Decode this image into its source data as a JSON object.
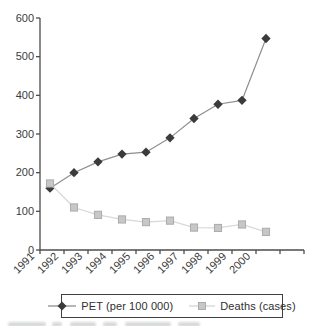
{
  "chart_data": {
    "type": "line",
    "title": "",
    "xlabel": "",
    "ylabel": "",
    "categories": [
      "1991",
      "1992",
      "1993",
      "1994",
      "1995",
      "1996",
      "1997",
      "1998",
      "1999",
      "2000"
    ],
    "series": [
      {
        "name": "PET (per 100 000)",
        "marker": "diamond",
        "marker_color": "#3b3b3b",
        "line_color": "#8e8e8e",
        "values": [
          160,
          200,
          228,
          248,
          253,
          290,
          340,
          377,
          387,
          547
        ]
      },
      {
        "name": "Deaths (cases)",
        "marker": "square",
        "marker_color": "#c7c7c7",
        "marker_border": "#a6a6a6",
        "line_color": "#d8d8d8",
        "values": [
          172,
          110,
          91,
          79,
          72,
          76,
          58,
          57,
          66,
          47
        ]
      }
    ],
    "ylim": [
      0,
      600
    ],
    "yticks": [
      0,
      100,
      200,
      300,
      400,
      500,
      600
    ],
    "grid": false,
    "legend_position": "bottom",
    "axis_color": "#4d4d4d",
    "text_color": "#3c3c3c"
  }
}
